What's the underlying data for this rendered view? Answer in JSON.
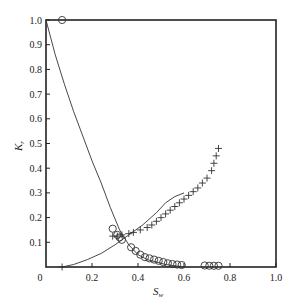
{
  "chart_data": {
    "type": "scatter",
    "title": "",
    "xlabel": "S_w",
    "ylabel": "K_r",
    "xlim": [
      0,
      1.0
    ],
    "ylim": [
      0,
      1.0
    ],
    "grid": false,
    "legend": null,
    "x_ticks": [
      "0",
      "0.2",
      "0.4",
      "0.6",
      "0.8",
      "1.0"
    ],
    "y_ticks": [
      "0.1",
      "0.2",
      "0.3",
      "0.4",
      "0.5",
      "0.6",
      "0.7",
      "0.8",
      "0.9",
      "1.0"
    ],
    "series": [
      {
        "name": "kro-measured",
        "marker": "circle",
        "x": [
          0.07,
          0.29,
          0.31,
          0.32,
          0.33,
          0.37,
          0.39,
          0.41,
          0.43,
          0.45,
          0.47,
          0.49,
          0.51,
          0.53,
          0.55,
          0.57,
          0.59,
          0.69,
          0.71,
          0.73,
          0.75
        ],
        "y": [
          1.0,
          0.155,
          0.13,
          0.12,
          0.11,
          0.08,
          0.065,
          0.05,
          0.04,
          0.035,
          0.03,
          0.025,
          0.02,
          0.015,
          0.012,
          0.01,
          0.008,
          0.006,
          0.005,
          0.005,
          0.005
        ]
      },
      {
        "name": "krw-measured",
        "marker": "plus",
        "x": [
          0.07,
          0.29,
          0.31,
          0.33,
          0.36,
          0.38,
          0.41,
          0.44,
          0.46,
          0.48,
          0.5,
          0.52,
          0.54,
          0.56,
          0.58,
          0.6,
          0.62,
          0.64,
          0.66,
          0.68,
          0.7,
          0.72,
          0.73,
          0.74,
          0.75
        ],
        "y": [
          0.0,
          0.125,
          0.125,
          0.13,
          0.135,
          0.14,
          0.15,
          0.16,
          0.17,
          0.185,
          0.2,
          0.215,
          0.23,
          0.245,
          0.26,
          0.275,
          0.29,
          0.305,
          0.32,
          0.34,
          0.36,
          0.39,
          0.42,
          0.45,
          0.48
        ]
      },
      {
        "name": "kro-curve",
        "marker": "line",
        "x": [
          0.0,
          0.04,
          0.08,
          0.12,
          0.16,
          0.2,
          0.24,
          0.28,
          0.32,
          0.36,
          0.4,
          0.44,
          0.48,
          0.52,
          0.56,
          0.6
        ],
        "y": [
          1.0,
          0.86,
          0.74,
          0.63,
          0.53,
          0.43,
          0.34,
          0.24,
          0.15,
          0.09,
          0.05,
          0.03,
          0.02,
          0.01,
          0.005,
          0.0
        ]
      },
      {
        "name": "krw-curve",
        "marker": "line",
        "x": [
          0.07,
          0.12,
          0.18,
          0.24,
          0.3,
          0.36,
          0.42,
          0.48,
          0.52,
          0.56,
          0.6
        ],
        "y": [
          0.0,
          0.01,
          0.03,
          0.055,
          0.09,
          0.13,
          0.17,
          0.22,
          0.26,
          0.285,
          0.3
        ]
      }
    ]
  },
  "labels": {
    "xlabel_main": "S",
    "xlabel_sub": "w",
    "ylabel_main": "K",
    "ylabel_sub": "r",
    "origin": "0"
  }
}
